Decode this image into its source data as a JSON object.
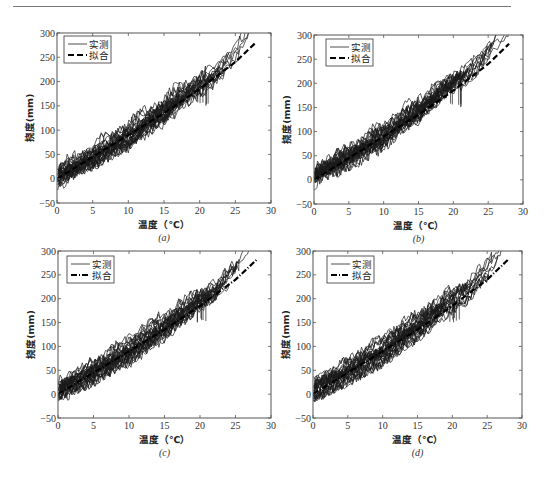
{
  "figure": {
    "panels": [
      {
        "id": "a",
        "caption": "(a)",
        "box": {
          "left": 57,
          "top": 33,
          "right": 271,
          "bottom": 203
        },
        "legend": {
          "x": 64,
          "y": 36
        },
        "seed": 11,
        "fit_style": "dashed"
      },
      {
        "id": "b",
        "caption": "(b)",
        "box": {
          "left": 314,
          "top": 35,
          "right": 523,
          "bottom": 204
        },
        "legend": {
          "x": 326,
          "y": 39
        },
        "seed": 23,
        "fit_style": "dashed"
      },
      {
        "id": "c",
        "caption": "(c)",
        "box": {
          "left": 58,
          "top": 251,
          "right": 271,
          "bottom": 418
        },
        "legend": {
          "x": 67,
          "y": 256
        },
        "seed": 37,
        "fit_style": "dashdot"
      },
      {
        "id": "d",
        "caption": "(d)",
        "box": {
          "left": 313,
          "top": 251,
          "right": 522,
          "bottom": 418
        },
        "legend": {
          "x": 327,
          "y": 256
        },
        "seed": 53,
        "fit_style": "dashdot"
      }
    ]
  },
  "chart_data": [
    {
      "type": "line",
      "panel": "a",
      "title": "",
      "caption": "(a)",
      "xlabel": "温度（℃）",
      "ylabel": "挠度(mm)",
      "xlim": [
        0,
        30
      ],
      "ylim": [
        -50,
        300
      ],
      "xticks": [
        0,
        5,
        10,
        15,
        20,
        25,
        30
      ],
      "yticks": [
        -50,
        0,
        50,
        100,
        150,
        200,
        250,
        300
      ],
      "grid": false,
      "legend_position": "upper left",
      "series": [
        {
          "name": "实测",
          "style": "solid-thin",
          "x": [
            0,
            2,
            5,
            8,
            10,
            13,
            15,
            17,
            20,
            22,
            25,
            27
          ],
          "values": [
            5,
            25,
            50,
            80,
            95,
            130,
            145,
            170,
            200,
            215,
            260,
            300
          ]
        },
        {
          "name": "拟合",
          "style": "dashed-thick",
          "x": [
            0,
            5,
            10,
            15,
            20,
            25,
            28
          ],
          "values": [
            0,
            45,
            90,
            135,
            185,
            240,
            282
          ]
        }
      ]
    },
    {
      "type": "line",
      "panel": "b",
      "title": "",
      "caption": "(b)",
      "xlabel": "温度（℃）",
      "ylabel": "挠度(mm)",
      "xlim": [
        0,
        30
      ],
      "ylim": [
        -50,
        300
      ],
      "xticks": [
        0,
        5,
        10,
        15,
        20,
        25,
        30
      ],
      "yticks": [
        -50,
        0,
        50,
        100,
        150,
        200,
        250,
        300
      ],
      "grid": false,
      "legend_position": "upper left",
      "series": [
        {
          "name": "实测",
          "style": "solid-thin",
          "x": [
            0,
            2,
            5,
            8,
            10,
            13,
            15,
            17,
            20,
            22,
            25,
            27
          ],
          "values": [
            5,
            25,
            50,
            80,
            95,
            130,
            145,
            170,
            200,
            215,
            260,
            300
          ]
        },
        {
          "name": "拟合",
          "style": "dashed-thick",
          "x": [
            0,
            5,
            10,
            15,
            20,
            25,
            28
          ],
          "values": [
            0,
            45,
            90,
            135,
            185,
            240,
            282
          ]
        }
      ]
    },
    {
      "type": "line",
      "panel": "c",
      "title": "",
      "caption": "(c)",
      "xlabel": "温度（℃）",
      "ylabel": "挠度(mm)",
      "xlim": [
        0,
        30
      ],
      "ylim": [
        -50,
        300
      ],
      "xticks": [
        0,
        5,
        10,
        15,
        20,
        25,
        30
      ],
      "yticks": [
        -50,
        0,
        50,
        100,
        150,
        200,
        250,
        300
      ],
      "grid": false,
      "legend_position": "upper left",
      "series": [
        {
          "name": "实测",
          "style": "solid-thin",
          "x": [
            0,
            2,
            5,
            8,
            10,
            13,
            15,
            17,
            20,
            22,
            25,
            27
          ],
          "values": [
            5,
            25,
            50,
            80,
            95,
            130,
            145,
            170,
            200,
            215,
            260,
            300
          ]
        },
        {
          "name": "拟合",
          "style": "dashdot-thick",
          "x": [
            0,
            5,
            10,
            15,
            20,
            25,
            28
          ],
          "values": [
            0,
            45,
            90,
            135,
            185,
            240,
            282
          ]
        }
      ]
    },
    {
      "type": "line",
      "panel": "d",
      "title": "",
      "caption": "(d)",
      "xlabel": "温度（℃）",
      "ylabel": "挠度(mm)",
      "xlim": [
        0,
        30
      ],
      "ylim": [
        -50,
        300
      ],
      "xticks": [
        0,
        5,
        10,
        15,
        20,
        25,
        30
      ],
      "yticks": [
        -50,
        0,
        50,
        100,
        150,
        200,
        250,
        300
      ],
      "grid": false,
      "legend_position": "upper left",
      "series": [
        {
          "name": "实测",
          "style": "solid-thin",
          "x": [
            0,
            2,
            5,
            8,
            10,
            13,
            15,
            17,
            20,
            22,
            25,
            27
          ],
          "values": [
            5,
            25,
            50,
            80,
            95,
            130,
            145,
            170,
            200,
            215,
            260,
            300
          ]
        },
        {
          "name": "拟合",
          "style": "dashdot-thick",
          "x": [
            0,
            5,
            10,
            15,
            20,
            25,
            28
          ],
          "values": [
            0,
            45,
            90,
            135,
            185,
            240,
            282
          ]
        }
      ]
    }
  ]
}
